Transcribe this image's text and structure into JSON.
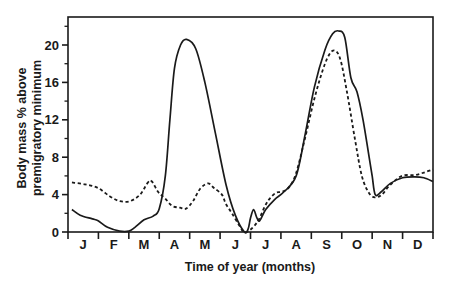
{
  "chart_data": {
    "type": "line",
    "title": "",
    "xlabel": "Time of year (months)",
    "ylabel_lines": [
      "Body mass % above",
      "premigratory minimum"
    ],
    "ylabel": "Body mass % above premigratory minimum",
    "x_tick_labels": [
      "J",
      "F",
      "M",
      "A",
      "M",
      "J",
      "J",
      "A",
      "S",
      "O",
      "N",
      "D"
    ],
    "y_ticks": [
      0,
      4,
      8,
      12,
      16,
      20
    ],
    "y_minor_ticks": [
      2,
      6,
      10,
      14,
      18,
      22
    ],
    "ylim": [
      0,
      23
    ],
    "xlim": [
      0,
      12
    ],
    "grid": false,
    "legend": null,
    "series": [
      {
        "name": "solid",
        "style": "solid",
        "color": "#1a1a1a",
        "points": [
          [
            0.13,
            2.4
          ],
          [
            0.4,
            1.8
          ],
          [
            0.8,
            1.4
          ],
          [
            0.99,
            1.2
          ],
          [
            1.3,
            0.5
          ],
          [
            1.7,
            0.1
          ],
          [
            2.0,
            0.1
          ],
          [
            2.2,
            0.5
          ],
          [
            2.5,
            1.3
          ],
          [
            2.8,
            1.7
          ],
          [
            3.0,
            2.5
          ],
          [
            3.2,
            6.0
          ],
          [
            3.35,
            12.0
          ],
          [
            3.5,
            17.5
          ],
          [
            3.7,
            20.0
          ],
          [
            3.9,
            20.6
          ],
          [
            4.2,
            19.6
          ],
          [
            4.5,
            16.0
          ],
          [
            4.85,
            10.5
          ],
          [
            5.2,
            5.0
          ],
          [
            5.5,
            1.8
          ],
          [
            5.8,
            0.0
          ],
          [
            5.92,
            0.3
          ],
          [
            6.0,
            1.5
          ],
          [
            6.1,
            2.4
          ],
          [
            6.2,
            1.6
          ],
          [
            6.3,
            1.2
          ],
          [
            6.5,
            2.4
          ],
          [
            6.8,
            3.5
          ],
          [
            7.1,
            4.3
          ],
          [
            7.5,
            6.0
          ],
          [
            7.8,
            10.5
          ],
          [
            8.1,
            15.5
          ],
          [
            8.45,
            19.5
          ],
          [
            8.7,
            21.2
          ],
          [
            8.9,
            21.5
          ],
          [
            9.1,
            20.8
          ],
          [
            9.3,
            16.5
          ],
          [
            9.5,
            15.0
          ],
          [
            9.7,
            12.0
          ],
          [
            9.9,
            8.0
          ],
          [
            10.0,
            6.0
          ],
          [
            10.1,
            4.0
          ],
          [
            10.3,
            4.3
          ],
          [
            10.6,
            5.2
          ],
          [
            11.0,
            5.8
          ],
          [
            11.4,
            5.9
          ],
          [
            11.7,
            5.8
          ],
          [
            12.0,
            5.4
          ]
        ]
      },
      {
        "name": "dashed",
        "style": "dashed",
        "color": "#1a1a1a",
        "points": [
          [
            0.13,
            5.3
          ],
          [
            0.56,
            5.1
          ],
          [
            0.99,
            4.7
          ],
          [
            1.38,
            3.8
          ],
          [
            1.71,
            3.3
          ],
          [
            2.04,
            3.3
          ],
          [
            2.37,
            4.0
          ],
          [
            2.63,
            5.3
          ],
          [
            2.76,
            5.4
          ],
          [
            2.96,
            4.3
          ],
          [
            3.19,
            3.6
          ],
          [
            3.42,
            2.8
          ],
          [
            3.68,
            2.6
          ],
          [
            3.88,
            2.5
          ],
          [
            4.11,
            3.3
          ],
          [
            4.34,
            4.6
          ],
          [
            4.6,
            5.2
          ],
          [
            4.8,
            4.7
          ],
          [
            5.06,
            4.0
          ],
          [
            5.19,
            3.0
          ],
          [
            5.39,
            2.0
          ],
          [
            5.65,
            0.6
          ],
          [
            5.78,
            0.0
          ],
          [
            5.98,
            0.2
          ],
          [
            6.25,
            1.2
          ],
          [
            6.48,
            2.8
          ],
          [
            6.64,
            3.6
          ],
          [
            6.84,
            4.2
          ],
          [
            7.04,
            4.3
          ],
          [
            7.27,
            4.8
          ],
          [
            7.5,
            6.3
          ],
          [
            7.79,
            10.0
          ],
          [
            8.12,
            14.5
          ],
          [
            8.45,
            18.0
          ],
          [
            8.71,
            19.4
          ],
          [
            8.94,
            18.6
          ],
          [
            9.17,
            15.0
          ],
          [
            9.43,
            10.0
          ],
          [
            9.66,
            6.0
          ],
          [
            9.89,
            4.2
          ],
          [
            10.09,
            3.7
          ],
          [
            10.32,
            4.0
          ],
          [
            10.58,
            5.0
          ],
          [
            10.98,
            6.0
          ],
          [
            11.41,
            6.1
          ],
          [
            11.74,
            6.4
          ],
          [
            12.0,
            6.7
          ]
        ]
      }
    ]
  }
}
